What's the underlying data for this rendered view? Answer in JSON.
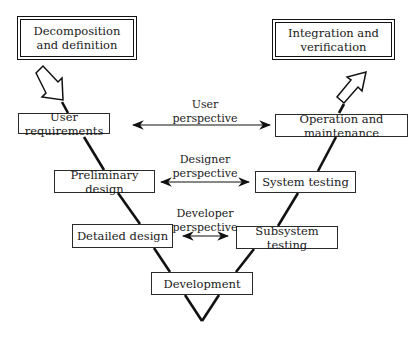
{
  "diagram": {
    "type": "V-model",
    "top_boxes": {
      "left": "Decomposition and definition",
      "right": "Integration and verification"
    },
    "left_side": [
      {
        "label": "User requirements"
      },
      {
        "label": "Preliminary design"
      },
      {
        "label": "Detailed design"
      }
    ],
    "right_side": [
      {
        "label": "Operation and maintenance"
      },
      {
        "label": "System testing"
      },
      {
        "label": "Subsystem testing"
      }
    ],
    "bottom": {
      "label": "Development"
    },
    "perspectives": [
      {
        "line1": "User",
        "line2": "perspective"
      },
      {
        "line1": "Designer",
        "line2": "perspective"
      },
      {
        "line1": "Developer",
        "line2": "perspective"
      }
    ]
  }
}
